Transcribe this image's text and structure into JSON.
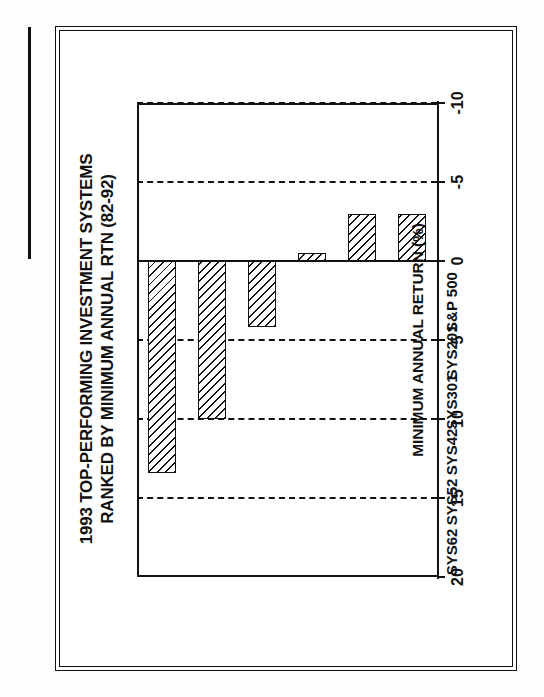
{
  "figure": {
    "label": "FIGURE 17"
  },
  "chart_data": {
    "type": "bar",
    "orientation": "horizontal-rotated",
    "title": "1993 TOP-PERFORMING INVESTMENT SYSTEMS RANKED BY MINIMUM ANNUAL RTN (82-92)",
    "title_lines": [
      "1993 TOP-PERFORMING INVESTMENT SYSTEMS",
      "RANKED BY MINIMUM ANNUAL RTN (82-92)"
    ],
    "categories": [
      "SYS62",
      "SYS52",
      "SYS42",
      "SYS301",
      "SYS201",
      "S&P 500"
    ],
    "values": [
      13.4,
      10.0,
      4.2,
      -0.5,
      -3.0,
      -3.0
    ],
    "xlabel": "",
    "ylabel": "MINIMUM ANNUAL RETURN (%)",
    "ylim": [
      -10,
      20
    ],
    "ticks": [
      "20",
      "15",
      "10",
      "5",
      "0",
      "-5",
      "-10"
    ],
    "tick_values": [
      20,
      15,
      10,
      5,
      0,
      -5,
      -10
    ],
    "grid": true,
    "grid_style": "dashed",
    "legend": "none",
    "bar_fill": "diagonal-hatch",
    "colors": {
      "ink": "#111111",
      "paper": "#ffffff",
      "bar_hatch": "#111111"
    }
  }
}
